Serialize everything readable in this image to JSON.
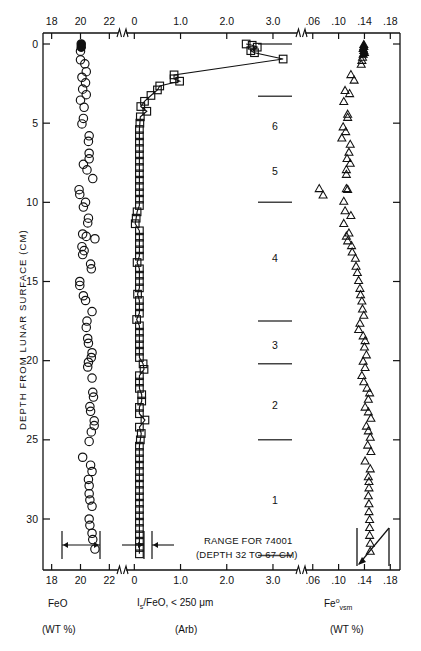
{
  "figure": {
    "y_axis_title": "DEPTH FROM LUNAR SURFACE (CM)",
    "y_ticks": [
      0,
      5,
      10,
      15,
      20,
      25,
      30
    ],
    "y_range": [
      -0.6,
      33.5
    ],
    "annotation_range_line1": "RANGE FOR 74001",
    "annotation_range_line2": "(DEPTH 32 TO 67 CM)",
    "core_layers": [
      "6",
      "5",
      "4",
      "3",
      "2",
      "1"
    ],
    "layer_boundaries_cm": [
      0.0,
      3.3,
      10.0,
      17.5,
      20.2,
      25.0,
      32.3
    ],
    "layer_label_depths_cm": [
      5.2,
      8.0,
      13.5,
      19.0,
      22.8,
      28.8
    ]
  },
  "panels": {
    "feo": {
      "title": "FeO",
      "units": "(WT %)",
      "ticks": [
        "18",
        "20",
        "22"
      ],
      "tick_values": [
        18,
        20,
        22
      ],
      "xlim": [
        17.4,
        22.6
      ],
      "marker": "open-circle",
      "error_bar_label": "precision-bar-feo"
    },
    "is_feo": {
      "title_parts": {
        "I": "I",
        "s": "s",
        "rest": "/FeO, < 250 μm"
      },
      "title": "I_s/FeO, < 250 µm",
      "units": "(Arb)",
      "ticks": [
        "0",
        "1.0",
        "2.0",
        "3.0"
      ],
      "tick_values": [
        0,
        1.0,
        2.0,
        3.0
      ],
      "xlim": [
        -0.18,
        3.52
      ],
      "marker": "open-square",
      "connected": true,
      "error_bar_label": "precision-bar-isfeo"
    },
    "fe_vsm": {
      "title_parts": {
        "base": "Fe",
        "sup": "o",
        "sub": "vsm"
      },
      "title": "Fe°vsm",
      "units": "(WT %)",
      "ticks": [
        ".06",
        ".10",
        ".14",
        ".18"
      ],
      "tick_values": [
        0.06,
        0.1,
        0.14,
        0.18
      ],
      "xlim": [
        0.048,
        0.195
      ],
      "marker": "open-triangle",
      "range_indicator_label": "range-for-74001-indicator"
    }
  },
  "chart_data": {
    "type": "scatter",
    "title": "",
    "xlabel": "FeO (WT %) / Is/FeO (Arb) / Fe°vsm (WT %)",
    "ylabel": "DEPTH FROM LUNAR SURFACE (CM)",
    "ylim": [
      33.5,
      -0.6
    ],
    "grid": false,
    "legend": "none",
    "axis_breaks": [
      {
        "after": "22",
        "before": "0"
      },
      {
        "after": "3.0",
        "before": ".06"
      }
    ],
    "series": [
      {
        "name": "FeO",
        "marker": "open-circle",
        "xlabel": "FeO",
        "xunits": "(WT %)",
        "xlim": [
          17.4,
          22.6
        ],
        "xticks": [
          18,
          20,
          22
        ],
        "points": [
          [
            20.05,
            0.0
          ],
          [
            20.05,
            0.2
          ],
          [
            20.0,
            0.45
          ],
          [
            20.0,
            1.0
          ],
          [
            20.3,
            1.25
          ],
          [
            20.4,
            1.75
          ],
          [
            20.1,
            2.1
          ],
          [
            20.35,
            2.45
          ],
          [
            20.15,
            2.85
          ],
          [
            20.4,
            3.2
          ],
          [
            20.0,
            3.55
          ],
          [
            20.25,
            4.0
          ],
          [
            20.2,
            4.7
          ],
          [
            20.1,
            5.05
          ],
          [
            20.6,
            5.8
          ],
          [
            20.55,
            6.15
          ],
          [
            20.6,
            6.9
          ],
          [
            20.6,
            7.25
          ],
          [
            20.2,
            7.6
          ],
          [
            20.45,
            7.95
          ],
          [
            20.85,
            8.5
          ],
          [
            19.9,
            9.2
          ],
          [
            19.95,
            9.5
          ],
          [
            20.35,
            10.0
          ],
          [
            20.2,
            10.3
          ],
          [
            20.55,
            11.0
          ],
          [
            20.5,
            11.3
          ],
          [
            20.15,
            12.0
          ],
          [
            20.4,
            12.15
          ],
          [
            21.0,
            12.3
          ],
          [
            20.1,
            12.8
          ],
          [
            20.25,
            13.05
          ],
          [
            20.15,
            13.3
          ],
          [
            20.7,
            13.9
          ],
          [
            20.75,
            14.2
          ],
          [
            19.95,
            15.0
          ],
          [
            19.95,
            15.25
          ],
          [
            20.2,
            15.9
          ],
          [
            20.35,
            16.2
          ],
          [
            20.8,
            16.9
          ],
          [
            20.45,
            17.5
          ],
          [
            20.4,
            17.9
          ],
          [
            20.5,
            18.6
          ],
          [
            20.55,
            18.9
          ],
          [
            20.8,
            19.5
          ],
          [
            20.75,
            19.8
          ],
          [
            20.55,
            20.1
          ],
          [
            20.5,
            20.4
          ],
          [
            20.8,
            21.1
          ],
          [
            20.85,
            22.0
          ],
          [
            20.9,
            22.3
          ],
          [
            20.65,
            22.9
          ],
          [
            20.7,
            23.2
          ],
          [
            20.95,
            23.8
          ],
          [
            20.95,
            24.1
          ],
          [
            20.75,
            24.5
          ],
          [
            20.6,
            25.1
          ],
          [
            20.15,
            26.1
          ],
          [
            20.7,
            26.6
          ],
          [
            20.8,
            27.0
          ],
          [
            20.55,
            27.5
          ],
          [
            20.6,
            27.9
          ],
          [
            20.6,
            28.4
          ],
          [
            20.65,
            28.8
          ],
          [
            20.8,
            29.2
          ],
          [
            20.6,
            30.0
          ],
          [
            20.65,
            30.4
          ],
          [
            20.8,
            30.9
          ],
          [
            20.85,
            31.3
          ],
          [
            21.0,
            31.9
          ]
        ]
      },
      {
        "name": "Is/FeO, < 250 um",
        "marker": "open-square",
        "connected": true,
        "xlabel": "I_s/FeO, < 250 µm",
        "xunits": "(Arb)",
        "xlim": [
          -0.18,
          3.52
        ],
        "xticks": [
          0,
          1.0,
          2.0,
          3.0
        ],
        "points": [
          [
            2.42,
            0.0
          ],
          [
            2.55,
            0.08
          ],
          [
            2.66,
            0.2
          ],
          [
            2.52,
            0.42
          ],
          [
            2.6,
            0.55
          ],
          [
            3.22,
            0.95
          ],
          [
            0.86,
            1.95
          ],
          [
            0.86,
            2.2
          ],
          [
            0.98,
            2.35
          ],
          [
            0.55,
            2.65
          ],
          [
            0.5,
            2.9
          ],
          [
            0.36,
            3.25
          ],
          [
            0.22,
            3.62
          ],
          [
            0.14,
            3.95
          ],
          [
            0.27,
            4.25
          ],
          [
            0.13,
            4.6
          ],
          [
            0.12,
            5.0
          ],
          [
            0.11,
            5.4
          ],
          [
            0.11,
            5.8
          ],
          [
            0.11,
            6.2
          ],
          [
            0.11,
            6.6
          ],
          [
            0.11,
            7.0
          ],
          [
            0.11,
            7.4
          ],
          [
            0.11,
            7.8
          ],
          [
            0.11,
            8.2
          ],
          [
            0.11,
            8.6
          ],
          [
            0.11,
            9.0
          ],
          [
            0.11,
            9.4
          ],
          [
            0.11,
            9.8
          ],
          [
            0.11,
            10.2
          ],
          [
            0.06,
            10.6
          ],
          [
            0.04,
            11.0
          ],
          [
            0.02,
            11.35
          ],
          [
            0.11,
            11.8
          ],
          [
            0.11,
            12.2
          ],
          [
            0.11,
            12.6
          ],
          [
            0.11,
            13.0
          ],
          [
            0.11,
            13.4
          ],
          [
            0.06,
            13.8
          ],
          [
            0.11,
            14.2
          ],
          [
            0.11,
            14.6
          ],
          [
            0.11,
            15.0
          ],
          [
            0.11,
            15.4
          ],
          [
            0.07,
            15.8
          ],
          [
            0.11,
            16.2
          ],
          [
            0.11,
            16.6
          ],
          [
            0.11,
            17.0
          ],
          [
            0.05,
            17.4
          ],
          [
            0.11,
            17.8
          ],
          [
            0.11,
            18.2
          ],
          [
            0.11,
            18.6
          ],
          [
            0.11,
            19.0
          ],
          [
            0.11,
            19.4
          ],
          [
            0.11,
            19.8
          ],
          [
            0.19,
            20.2
          ],
          [
            0.21,
            20.55
          ],
          [
            0.11,
            20.95
          ],
          [
            0.11,
            21.35
          ],
          [
            0.11,
            21.75
          ],
          [
            0.16,
            22.15
          ],
          [
            0.16,
            22.55
          ],
          [
            0.11,
            22.95
          ],
          [
            0.11,
            23.35
          ],
          [
            0.23,
            23.75
          ],
          [
            0.11,
            24.2
          ],
          [
            0.15,
            24.6
          ],
          [
            0.13,
            25.0
          ],
          [
            0.11,
            25.4
          ],
          [
            0.11,
            25.8
          ],
          [
            0.11,
            26.2
          ],
          [
            0.11,
            26.6
          ],
          [
            0.11,
            27.0
          ],
          [
            0.11,
            27.4
          ],
          [
            0.11,
            27.8
          ],
          [
            0.11,
            28.2
          ],
          [
            0.11,
            28.6
          ],
          [
            0.11,
            29.0
          ],
          [
            0.11,
            29.4
          ],
          [
            0.11,
            29.8
          ],
          [
            0.11,
            30.2
          ],
          [
            0.11,
            30.6
          ],
          [
            0.11,
            31.0
          ],
          [
            0.11,
            31.4
          ],
          [
            0.11,
            31.8
          ],
          [
            0.11,
            32.2
          ]
        ]
      },
      {
        "name": "Fe0 vsm",
        "marker": "open-triangle",
        "xlabel": "Fe°vsm",
        "xunits": "(WT %)",
        "xlim": [
          0.048,
          0.195
        ],
        "xticks": [
          0.06,
          0.1,
          0.14,
          0.18
        ],
        "points": [
          [
            0.139,
            0.0
          ],
          [
            0.139,
            0.12
          ],
          [
            0.138,
            0.25
          ],
          [
            0.139,
            0.38
          ],
          [
            0.14,
            0.5
          ],
          [
            0.138,
            0.62
          ],
          [
            0.137,
            0.8
          ],
          [
            0.136,
            1.0
          ],
          [
            0.135,
            1.25
          ],
          [
            0.119,
            1.9
          ],
          [
            0.124,
            2.25
          ],
          [
            0.11,
            2.9
          ],
          [
            0.117,
            3.1
          ],
          [
            0.108,
            3.6
          ],
          [
            0.114,
            4.4
          ],
          [
            0.114,
            4.6
          ],
          [
            0.107,
            5.2
          ],
          [
            0.111,
            5.5
          ],
          [
            0.105,
            5.9
          ],
          [
            0.118,
            6.3
          ],
          [
            0.116,
            6.8
          ],
          [
            0.113,
            7.2
          ],
          [
            0.118,
            7.5
          ],
          [
            0.112,
            7.9
          ],
          [
            0.112,
            8.2
          ],
          [
            0.07,
            9.1
          ],
          [
            0.076,
            9.5
          ],
          [
            0.112,
            9.1
          ],
          [
            0.114,
            9.15
          ],
          [
            0.108,
            9.9
          ],
          [
            0.11,
            10.5
          ],
          [
            0.119,
            10.8
          ],
          [
            0.108,
            11.3
          ],
          [
            0.116,
            11.9
          ],
          [
            0.112,
            12.1
          ],
          [
            0.114,
            12.4
          ],
          [
            0.12,
            12.7
          ],
          [
            0.121,
            13.1
          ],
          [
            0.126,
            13.5
          ],
          [
            0.127,
            14.0
          ],
          [
            0.129,
            14.4
          ],
          [
            0.131,
            14.9
          ],
          [
            0.133,
            15.4
          ],
          [
            0.134,
            15.8
          ],
          [
            0.136,
            16.2
          ],
          [
            0.137,
            16.7
          ],
          [
            0.139,
            17.1
          ],
          [
            0.133,
            17.6
          ],
          [
            0.131,
            18.0
          ],
          [
            0.138,
            18.4
          ],
          [
            0.141,
            18.7
          ],
          [
            0.14,
            19.1
          ],
          [
            0.143,
            19.6
          ],
          [
            0.138,
            20.0
          ],
          [
            0.141,
            20.4
          ],
          [
            0.136,
            20.9
          ],
          [
            0.139,
            21.3
          ],
          [
            0.144,
            21.7
          ],
          [
            0.148,
            22.0
          ],
          [
            0.146,
            22.4
          ],
          [
            0.141,
            22.9
          ],
          [
            0.146,
            23.2
          ],
          [
            0.15,
            23.6
          ],
          [
            0.143,
            24.1
          ],
          [
            0.146,
            24.4
          ],
          [
            0.149,
            24.8
          ],
          [
            0.145,
            25.3
          ],
          [
            0.15,
            25.7
          ],
          [
            0.141,
            26.3
          ],
          [
            0.149,
            26.8
          ],
          [
            0.146,
            27.3
          ],
          [
            0.147,
            27.6
          ],
          [
            0.147,
            28.0
          ],
          [
            0.146,
            28.5
          ],
          [
            0.147,
            29.0
          ],
          [
            0.147,
            29.5
          ],
          [
            0.148,
            30.0
          ],
          [
            0.148,
            30.5
          ],
          [
            0.148,
            31.0
          ],
          [
            0.149,
            31.5
          ],
          [
            0.149,
            32.0
          ]
        ]
      }
    ]
  }
}
